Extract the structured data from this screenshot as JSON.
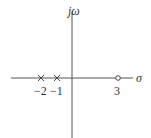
{
  "diagram": {
    "type": "pole-zero-plot",
    "axes": {
      "horizontal_label": "σ",
      "vertical_label": "jω"
    },
    "poles": [
      {
        "value": -2,
        "label": "−2",
        "marker": "x"
      },
      {
        "value": -1,
        "label": "−1",
        "marker": "x"
      }
    ],
    "zeros": [
      {
        "value": 3,
        "label": "3",
        "marker": "o"
      }
    ],
    "colors": {
      "axis": "#555555",
      "marker": "#444444",
      "text": "#333333"
    }
  }
}
